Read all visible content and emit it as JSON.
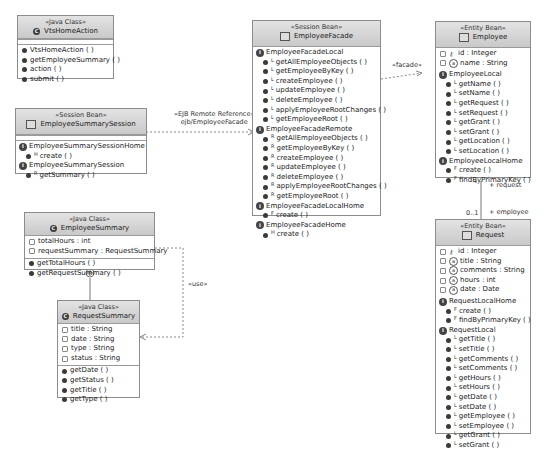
{
  "diagram": {
    "classes": {
      "vts_home_action": {
        "stereotype": "«Java Class»",
        "name": "VtsHomeAction",
        "methods": [
          "VtsHomeAction ( )",
          "getEmployeeSummary ( )",
          "action ( )",
          "submit ( )"
        ]
      },
      "employee_summary_session": {
        "stereotype": "«Session Bean»",
        "name": "EmployeeSummarySession",
        "interfaces": [
          {
            "name": "EmployeeSummarySessionHome",
            "methods": [
              {
                "marker": "H",
                "label": "create ( )"
              }
            ]
          },
          {
            "name": "EmployeeSummarySession",
            "methods": [
              {
                "marker": "R",
                "label": "getSummary ( )"
              }
            ]
          }
        ]
      },
      "employee_facade": {
        "stereotype": "«Session Bean»",
        "name": "EmployeeFacade",
        "interfaces": [
          {
            "name": "EmployeeFacadeLocal",
            "methods": [
              {
                "marker": "L",
                "label": "getAllEmployeeObjects ( )"
              },
              {
                "marker": "L",
                "label": "getEmployeeByKey ( )"
              },
              {
                "marker": "L",
                "label": "createEmployee ( )"
              },
              {
                "marker": "L",
                "label": "updateEmployee ( )"
              },
              {
                "marker": "L",
                "label": "deleteEmployee ( )"
              },
              {
                "marker": "L",
                "label": "applyEmployeeRootChanges ( )"
              },
              {
                "marker": "L",
                "label": "getEmployeeRoot ( )"
              }
            ]
          },
          {
            "name": "EmployeeFacadeRemote",
            "methods": [
              {
                "marker": "R",
                "label": "getAllEmployeeObjects ( )"
              },
              {
                "marker": "R",
                "label": "getEmployeeByKey ( )"
              },
              {
                "marker": "R",
                "label": "createEmployee ( )"
              },
              {
                "marker": "R",
                "label": "updateEmployee ( )"
              },
              {
                "marker": "R",
                "label": "deleteEmployee ( )"
              },
              {
                "marker": "R",
                "label": "applyEmployeeRootChanges ( )"
              },
              {
                "marker": "R",
                "label": "getEmployeeRoot ( )"
              }
            ]
          },
          {
            "name": "EmployeeFacadeLocalHome",
            "methods": [
              {
                "marker": "F",
                "label": "create ( )"
              }
            ]
          },
          {
            "name": "EmployeeFacadeHome",
            "methods": [
              {
                "marker": "H",
                "label": "create ( )"
              }
            ]
          }
        ]
      },
      "employee": {
        "stereotype": "«Entity Bean»",
        "name": "Employee",
        "attributes": [
          {
            "kind": "key",
            "label": "id : Integer"
          },
          {
            "kind": "attr",
            "label": "name : String"
          }
        ],
        "interfaces": [
          {
            "name": "EmployeeLocal",
            "methods": [
              {
                "marker": "L",
                "label": "getName ( )"
              },
              {
                "marker": "L",
                "label": "setName ( )"
              },
              {
                "marker": "L",
                "label": "getRequest ( )"
              },
              {
                "marker": "L",
                "label": "setRequest ( )"
              },
              {
                "marker": "L",
                "label": "getGrant ( )"
              },
              {
                "marker": "L",
                "label": "setGrant ( )"
              },
              {
                "marker": "L",
                "label": "getLocation ( )"
              },
              {
                "marker": "L",
                "label": "setLocation ( )"
              }
            ]
          },
          {
            "name": "EmployeeLocalHome",
            "methods": [
              {
                "marker": "F",
                "label": "create ( )"
              },
              {
                "marker": "F",
                "label": "findByPrimaryKey ( )"
              }
            ]
          }
        ]
      },
      "request": {
        "stereotype": "«Entity Bean»",
        "name": "Request",
        "attributes": [
          {
            "kind": "key",
            "label": "id : Integer"
          },
          {
            "kind": "attr",
            "label": "title : String"
          },
          {
            "kind": "attr",
            "label": "comments : String"
          },
          {
            "kind": "attr",
            "label": "hours : int"
          },
          {
            "kind": "attr",
            "label": "date : Date"
          }
        ],
        "interfaces": [
          {
            "name": "RequestLocalHome",
            "methods": [
              {
                "marker": "F",
                "label": "create ( )"
              },
              {
                "marker": "F",
                "label": "findByPrimaryKey ( )"
              }
            ]
          },
          {
            "name": "RequestLocal",
            "methods": [
              {
                "marker": "L",
                "label": "getTitle ( )"
              },
              {
                "marker": "L",
                "label": "setTitle ( )"
              },
              {
                "marker": "L",
                "label": "getComments ( )"
              },
              {
                "marker": "L",
                "label": "setComments ( )"
              },
              {
                "marker": "L",
                "label": "getHours ( )"
              },
              {
                "marker": "L",
                "label": "setHours ( )"
              },
              {
                "marker": "L",
                "label": "getDate ( )"
              },
              {
                "marker": "L",
                "label": "setDate ( )"
              },
              {
                "marker": "L",
                "label": "getEmployee ( )"
              },
              {
                "marker": "L",
                "label": "setEmployee ( )"
              },
              {
                "marker": "L",
                "label": "getGrant ( )"
              },
              {
                "marker": "L",
                "label": "setGrant ( )"
              }
            ]
          }
        ]
      },
      "employee_summary_class": {
        "stereotype": "«Java Class»",
        "name": "EmployeeSummary",
        "attributes": [
          "totalHours : int",
          "requestSummary : RequestSummary"
        ],
        "methods": [
          "getTotalHours ( )",
          "getRequestSummary ( )"
        ]
      },
      "request_summary": {
        "stereotype": "«Java Class»",
        "name": "RequestSummary",
        "attributes": [
          "title : String",
          "date : String",
          "type : String",
          "status : String"
        ],
        "methods": [
          "getDate ( )",
          "getStatus ( )",
          "getTitle ( )",
          "getType ( )"
        ]
      }
    },
    "connectors": {
      "ejb_ref_stereotype": "«EJB Remote Reference»",
      "ejb_ref_name": "ejb/EmployeeFacade",
      "facade_label": "«facade»",
      "use_label": "«use»",
      "request_role": "+ request",
      "employee_role": "+ employee",
      "many_mult": "*",
      "opt_mult": "0..1"
    }
  }
}
